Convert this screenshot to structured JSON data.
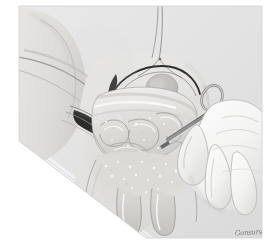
{
  "figure": {
    "medium": "grayscale line and wash medical illustration",
    "orientation": "portrait",
    "frame": {
      "width_px": 270,
      "height_px": 248,
      "paper_color": "#ffffff",
      "field_color": "#e2e2e2"
    }
  },
  "palette": {
    "paper_white": "#ffffff",
    "drape_gray": "#e3e3e3",
    "drape_gray_dark": "#d3d3d3",
    "skin_light": "#e8e7e5",
    "skin_mid": "#d9d8d5",
    "skin_shadow": "#c4c3c0",
    "tissue_light": "#efeeec",
    "tissue_mid": "#dcdbd8",
    "viscera_light": "#f2f1ef",
    "viscera_mid": "#cfcecb",
    "viscera_dark": "#b4b3b0",
    "incision_black": "#2b2b2b",
    "outline_gray": "#8a8a8a",
    "outline_dark": "#555555",
    "glove_white": "#f7f7f6",
    "glove_shadow": "#d8d8d6",
    "instrument_gray": "#9a9a9a",
    "instrument_dark": "#4a4a4a",
    "highlight_white": "#ffffff",
    "signature_gray": "#6b6b6b"
  },
  "anatomy": {
    "regions": [
      {
        "id": "drape-field",
        "label": "Surgical drape field",
        "tone": "#e3e3e3"
      },
      {
        "id": "thigh",
        "label": "Upper thigh",
        "tone": "#dedcd9"
      },
      {
        "id": "lower-abdomen",
        "label": "Lower abdominal wall",
        "tone": "#e0dedb"
      },
      {
        "id": "inguinal-canal",
        "label": "Inguinal canal, opened",
        "tone": "#cfcecb"
      },
      {
        "id": "hernia-sac",
        "label": "Herniated bowel / omentum",
        "tone": "#e9e8e6"
      },
      {
        "id": "spermatic-cord",
        "label": "Spermatic cord structures",
        "tone": "#d7d6d3"
      },
      {
        "id": "fascia-flap",
        "label": "Retracted fascial flap",
        "tone": "#d2d1ce"
      }
    ]
  },
  "instruments": [
    {
      "id": "suture-thread",
      "label": "Suture strand, superior",
      "tone": "#8f8f8f"
    },
    {
      "id": "retractor-blade",
      "label": "Retractor blade, left",
      "tone": "#2b2b2b"
    },
    {
      "id": "tissue-forceps",
      "label": "Tissue forceps held in right hand",
      "tone": "#7d7d7d"
    },
    {
      "id": "hemostat-ring",
      "label": "Ring handle of hemostat",
      "tone": "#9a9a9a"
    }
  ],
  "hand": {
    "id": "surgeon-hand",
    "label": "Gloved right hand of surgeon",
    "glove_tone": "#f7f7f6",
    "digits": [
      "thumb",
      "index",
      "middle",
      "ring"
    ]
  },
  "signature": {
    "text": "Gonsurs",
    "artist_mark": true,
    "position": "lower-right",
    "color": "#6b6b6b"
  },
  "annotations": {
    "labels": [],
    "leader_lines": []
  }
}
